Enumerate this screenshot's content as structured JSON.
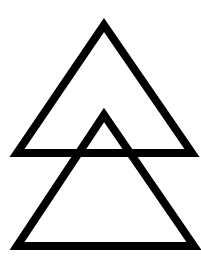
{
  "diagram": {
    "background": "#ffffff",
    "stroke_color": "#000000",
    "stroke_width": 8,
    "shapes": [
      {
        "name": "upper-triangle",
        "points": "104,25 17,153 192,153"
      },
      {
        "name": "lower-triangle",
        "points": "104,115 17,246 194,246"
      }
    ]
  }
}
